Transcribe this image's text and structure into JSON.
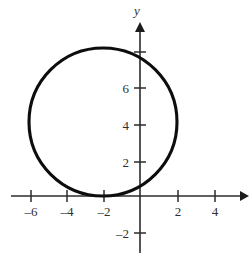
{
  "figure": {
    "width": 252,
    "height": 259,
    "background_color": "#ffffff"
  },
  "axes": {
    "y_axis_label": "y",
    "x_axis_label": "",
    "axis_color": "#2b2b2b",
    "origin_px": {
      "x": 140,
      "y": 196
    },
    "unit_px": 18.5
  },
  "chart_data": {
    "type": "scatter",
    "title": "",
    "subtitle": "",
    "xlabel": "",
    "ylabel": "y",
    "xlim": [
      -7.0,
      5.9
    ],
    "ylim": [
      -3.4,
      9.5
    ],
    "grid": false,
    "legend": null,
    "x_ticks": [
      -6,
      -4,
      -2,
      2,
      4
    ],
    "x_tick_labels": [
      "–6",
      "–4",
      "–2",
      "2",
      "4"
    ],
    "y_ticks": [
      -2,
      2,
      4,
      6,
      8
    ],
    "y_tick_labels": [
      "–2",
      "2",
      "4",
      "6",
      ""
    ],
    "annotations": [],
    "series": [
      {
        "name": "circle",
        "shape": "circle",
        "center": [
          -2,
          4
        ],
        "radius": 4,
        "stroke_color": "#0d0d0d",
        "stroke_width": 3.1,
        "fill": "none",
        "equation": "(x + 2)^2 + (y - 4)^2 = 16",
        "x_intercepts": [
          -2
        ],
        "y_intercepts": [],
        "extents": {
          "left": -6,
          "right": 2,
          "bottom": 0,
          "top": 8
        }
      }
    ]
  },
  "tick_label_positions": {
    "x": [
      {
        "label": "–6",
        "px": 31
      },
      {
        "label": "–4",
        "px": 67
      },
      {
        "label": "–2",
        "px": 104
      },
      {
        "label": "2",
        "px": 178
      },
      {
        "label": "4",
        "px": 215
      }
    ],
    "y": [
      {
        "label": "6",
        "px": 88
      },
      {
        "label": "4",
        "px": 125
      },
      {
        "label": "2",
        "px": 162
      },
      {
        "label": "–2",
        "px": 233
      }
    ]
  }
}
